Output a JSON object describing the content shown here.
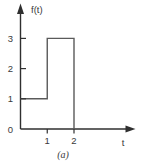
{
  "figure": {
    "caption": "(a)"
  },
  "chart_data": {
    "type": "line",
    "subtype": "step",
    "title": "",
    "xlabel": "t",
    "ylabel": "f(t)",
    "x_ticks": [
      "1",
      "2"
    ],
    "y_ticks": [
      "0",
      "1",
      "2",
      "3"
    ],
    "xlim": [
      0,
      4.2
    ],
    "ylim": [
      0,
      3.9
    ],
    "points": [
      [
        0,
        1
      ],
      [
        1,
        1
      ],
      [
        1,
        3
      ],
      [
        2,
        3
      ],
      [
        2,
        0
      ]
    ],
    "legend": null,
    "grid": false,
    "colors": {
      "axis": "#2f2f2f",
      "line": "#5a5a5a",
      "text": "#3a3a3a",
      "background": "#ffffff"
    }
  }
}
